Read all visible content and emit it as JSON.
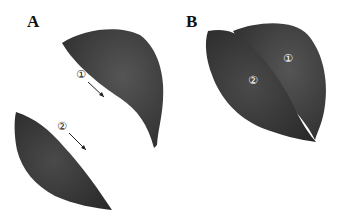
{
  "figure": {
    "panels": [
      {
        "label": "A",
        "description": "Leaf cut into two halves, separated",
        "parts": [
          {
            "marker": "①",
            "arrow": true
          },
          {
            "marker": "②",
            "arrow": true
          }
        ]
      },
      {
        "label": "B",
        "description": "Leaf halves rejoined",
        "parts": [
          {
            "marker": "①"
          },
          {
            "marker": "②"
          }
        ]
      }
    ],
    "colors": {
      "leaf": "#3a3a3a",
      "leaf_dark": "#2a2a2a",
      "background": "#ffffff",
      "marker_text": "#ffffff"
    }
  }
}
